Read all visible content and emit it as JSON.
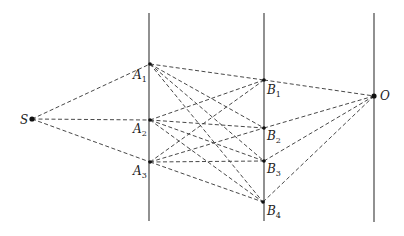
{
  "diagram": {
    "type": "ray-path diagram",
    "screens": [
      {
        "name": "screen-a",
        "x": 149,
        "y1": 13,
        "y2": 221
      },
      {
        "name": "screen-b",
        "x": 264,
        "y1": 13,
        "y2": 221
      },
      {
        "name": "screen-o",
        "x": 374,
        "y1": 13,
        "y2": 222
      }
    ],
    "points": {
      "S": {
        "label": "S",
        "sub": "",
        "x": 32,
        "y": 119,
        "lx": 20,
        "ly": 124
      },
      "A1": {
        "label": "A",
        "sub": "1",
        "x": 150,
        "y": 64,
        "lx": 133,
        "ly": 79
      },
      "A2": {
        "label": "A",
        "sub": "2",
        "x": 150,
        "y": 120,
        "lx": 133,
        "ly": 133
      },
      "A3": {
        "label": "A",
        "sub": "3",
        "x": 150,
        "y": 162,
        "lx": 133,
        "ly": 175
      },
      "B1": {
        "label": "B",
        "sub": "1",
        "x": 264,
        "y": 80,
        "lx": 267,
        "ly": 94
      },
      "B2": {
        "label": "B",
        "sub": "2",
        "x": 264,
        "y": 128,
        "lx": 267,
        "ly": 140
      },
      "B3": {
        "label": "B",
        "sub": "3",
        "x": 264,
        "y": 161,
        "lx": 267,
        "ly": 173
      },
      "B4": {
        "label": "B",
        "sub": "4",
        "x": 263,
        "y": 202,
        "lx": 267,
        "ly": 215
      },
      "O": {
        "label": "O",
        "sub": "",
        "x": 374,
        "y": 96,
        "lx": 380,
        "ly": 100
      }
    },
    "connections": [
      [
        "S",
        "A1"
      ],
      [
        "S",
        "A2"
      ],
      [
        "S",
        "A3"
      ],
      [
        "A1",
        "B1"
      ],
      [
        "A1",
        "B2"
      ],
      [
        "A1",
        "B3"
      ],
      [
        "A1",
        "B4"
      ],
      [
        "A2",
        "B1"
      ],
      [
        "A2",
        "B2"
      ],
      [
        "A2",
        "B3"
      ],
      [
        "A2",
        "B4"
      ],
      [
        "A3",
        "B1"
      ],
      [
        "A3",
        "B2"
      ],
      [
        "A3",
        "B3"
      ],
      [
        "A3",
        "B4"
      ],
      [
        "B1",
        "O"
      ],
      [
        "B2",
        "O"
      ],
      [
        "B3",
        "O"
      ],
      [
        "B4",
        "O"
      ]
    ],
    "colors": {
      "screen": "#555555",
      "ray": "#333333",
      "point": "#111111"
    }
  }
}
